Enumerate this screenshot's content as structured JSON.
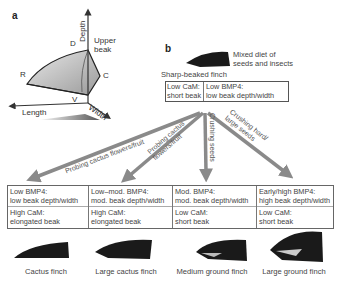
{
  "panel_a": {
    "label": "a",
    "axes": {
      "depth": "Depth",
      "length": "Length",
      "width": "Width"
    },
    "points": {
      "D": "D",
      "R": "R",
      "C": "C",
      "V": "V"
    },
    "upper_beak": [
      "Upper",
      "beak"
    ]
  },
  "panel_b": {
    "label": "b",
    "ancestor": {
      "name": "Sharp-beaked finch",
      "diet": [
        "Mixed diet of",
        "seeds and insects"
      ],
      "cam": [
        "Low CaM:",
        "short beak"
      ],
      "bmp4": [
        "Low BMP4:",
        "low beak depth/width"
      ]
    },
    "arrows": [
      {
        "label": "Probing cactus flowers/fruit"
      },
      {
        "label_lines": [
          "Probing cactus",
          "flowers/fruit"
        ]
      },
      {
        "label": "Crushing seeds"
      },
      {
        "label_lines": [
          "Crushing hard/",
          "large seeds"
        ]
      }
    ],
    "descendants": [
      {
        "bmp4": [
          "Low BMP4:",
          "low beak depth/width"
        ],
        "cam": [
          "High CaM:",
          "elongated beak"
        ],
        "name": "Cactus finch"
      },
      {
        "bmp4": [
          "Low–mod. BMP4:",
          "mod. beak depth/width"
        ],
        "cam": [
          "High CaM:",
          "elongated beak"
        ],
        "name": "Large cactus finch"
      },
      {
        "bmp4": [
          "Mod. BMP4:",
          "mod. beak depth/width"
        ],
        "cam": [
          "Low CaM:",
          "short beak"
        ],
        "name": "Medium ground finch"
      },
      {
        "bmp4": [
          "Early/high BMP4:",
          "high beak depth/width"
        ],
        "cam": [
          "Low CaM:",
          "short beak"
        ],
        "name": "Large ground finch"
      }
    ]
  },
  "colors": {
    "arrow": "#8a8a8a",
    "box_border": "#555555",
    "beak": "#1a1a1a",
    "text": "#444444"
  }
}
